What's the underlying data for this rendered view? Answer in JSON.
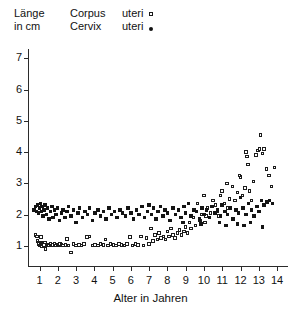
{
  "axis_label_y": {
    "line1": "Länge",
    "line2": "in cm"
  },
  "legend": {
    "items": [
      {
        "label_word1": "Corpus",
        "label_word2": "uteri",
        "marker": "open-square-marker",
        "series": "corpus"
      },
      {
        "label_word1": "Cervix",
        "label_word2": "uteri",
        "marker": "filled-dot-marker",
        "series": "cervix"
      }
    ]
  },
  "xlabel": "Alter in Jahren",
  "yticks": [
    "1",
    "2",
    "3",
    "4",
    "5",
    "6",
    "7"
  ],
  "xticks": [
    "1",
    "2",
    "3",
    "4",
    "5",
    "6",
    "7",
    "8",
    "9",
    "10",
    "11",
    "12",
    "13",
    "14"
  ],
  "chart_data": {
    "type": "scatter",
    "title": "",
    "xlabel": "Alter in Jahren",
    "ylabel": "Länge in cm",
    "xlim": [
      0.4,
      14.6
    ],
    "ylim": [
      0.35,
      7.3
    ],
    "grid": false,
    "legend_position": "top",
    "colors": {
      "corpus": "#1c1c1c",
      "cervix": "#141414"
    },
    "series": [
      {
        "name": "Corpus uteri",
        "marker": "open-square",
        "points": [
          [
            0.78,
            1.35
          ],
          [
            0.86,
            1.3
          ],
          [
            0.9,
            1.15
          ],
          [
            0.95,
            1.1
          ],
          [
            0.98,
            1.05
          ],
          [
            1.02,
            1.0
          ],
          [
            1.05,
            1.02
          ],
          [
            1.08,
            1.28
          ],
          [
            1.12,
            1.08
          ],
          [
            1.15,
            0.98
          ],
          [
            1.2,
            1.05
          ],
          [
            1.25,
            1.02
          ],
          [
            1.3,
            1.1
          ],
          [
            1.34,
            0.9
          ],
          [
            1.4,
            1.0
          ],
          [
            1.46,
            1.03
          ],
          [
            1.52,
            1.0
          ],
          [
            1.6,
            1.05
          ],
          [
            1.68,
            1.0
          ],
          [
            1.75,
            1.02
          ],
          [
            1.82,
            1.06
          ],
          [
            1.9,
            1.0
          ],
          [
            1.98,
            1.03
          ],
          [
            2.05,
            1.0
          ],
          [
            2.12,
            1.05
          ],
          [
            2.2,
            1.02
          ],
          [
            2.3,
            1.0
          ],
          [
            2.42,
            1.02
          ],
          [
            2.5,
            1.22
          ],
          [
            2.6,
            1.0
          ],
          [
            2.72,
            0.78
          ],
          [
            2.85,
            1.05
          ],
          [
            3.0,
            1.0
          ],
          [
            3.15,
            1.02
          ],
          [
            3.3,
            1.0
          ],
          [
            3.45,
            1.05
          ],
          [
            3.6,
            1.28
          ],
          [
            3.75,
            1.3
          ],
          [
            3.9,
            1.0
          ],
          [
            4.05,
            1.03
          ],
          [
            4.2,
            1.0
          ],
          [
            4.35,
            1.05
          ],
          [
            4.5,
            1.02
          ],
          [
            4.62,
            1.2
          ],
          [
            4.75,
            1.0
          ],
          [
            4.9,
            1.05
          ],
          [
            5.05,
            1.02
          ],
          [
            5.2,
            1.0
          ],
          [
            5.35,
            1.05
          ],
          [
            5.5,
            1.03
          ],
          [
            5.65,
            1.0
          ],
          [
            5.8,
            1.05
          ],
          [
            5.95,
            1.28
          ],
          [
            6.1,
            1.0
          ],
          [
            6.25,
            1.05
          ],
          [
            6.4,
            1.02
          ],
          [
            6.55,
            1.3
          ],
          [
            6.7,
            1.0
          ],
          [
            6.85,
            1.25
          ],
          [
            7.0,
            1.05
          ],
          [
            7.1,
            1.55
          ],
          [
            7.2,
            1.15
          ],
          [
            7.32,
            1.35
          ],
          [
            7.45,
            1.2
          ],
          [
            7.55,
            1.4
          ],
          [
            7.65,
            1.25
          ],
          [
            7.78,
            1.3
          ],
          [
            7.9,
            1.2
          ],
          [
            8.0,
            1.45
          ],
          [
            8.1,
            1.3
          ],
          [
            8.2,
            1.55
          ],
          [
            8.3,
            1.35
          ],
          [
            8.42,
            1.25
          ],
          [
            8.55,
            1.4
          ],
          [
            8.65,
            1.5
          ],
          [
            8.78,
            1.35
          ],
          [
            8.9,
            1.45
          ],
          [
            9.0,
            1.6
          ],
          [
            9.1,
            1.4
          ],
          [
            9.2,
            1.75
          ],
          [
            9.3,
            1.55
          ],
          [
            9.42,
            1.9
          ],
          [
            9.55,
            1.65
          ],
          [
            9.65,
            2.35
          ],
          [
            9.78,
            1.8
          ],
          [
            9.9,
            2.0
          ],
          [
            10.0,
            2.6
          ],
          [
            10.1,
            1.95
          ],
          [
            10.2,
            2.2
          ],
          [
            10.35,
            2.05
          ],
          [
            10.5,
            2.45
          ],
          [
            10.62,
            2.3
          ],
          [
            10.75,
            2.1
          ],
          [
            10.9,
            2.6
          ],
          [
            11.0,
            2.75
          ],
          [
            11.12,
            2.35
          ],
          [
            11.25,
            3.0
          ],
          [
            11.4,
            2.5
          ],
          [
            11.55,
            2.9
          ],
          [
            11.7,
            2.45
          ],
          [
            11.85,
            2.7
          ],
          [
            12.0,
            3.2
          ],
          [
            12.1,
            2.6
          ],
          [
            12.25,
            2.85
          ],
          [
            12.4,
            3.6
          ],
          [
            12.5,
            2.75
          ],
          [
            12.6,
            2.45
          ],
          [
            12.72,
            3.05
          ],
          [
            12.85,
            3.9
          ],
          [
            12.95,
            4.05
          ],
          [
            13.05,
            4.1
          ],
          [
            13.1,
            4.55
          ],
          [
            13.2,
            3.95
          ],
          [
            13.3,
            4.1
          ],
          [
            13.42,
            3.45
          ],
          [
            13.55,
            3.25
          ],
          [
            13.7,
            2.9
          ],
          [
            13.85,
            3.5
          ],
          [
            12.3,
            4.0
          ],
          [
            12.35,
            3.85
          ],
          [
            11.95,
            3.25
          ],
          [
            11.3,
            2.2
          ],
          [
            10.8,
            1.95
          ],
          [
            10.05,
            1.75
          ],
          [
            9.6,
            2.1
          ]
        ]
      },
      {
        "name": "Cervix uteri",
        "marker": "filled-square",
        "points": [
          [
            0.7,
            2.15
          ],
          [
            0.78,
            2.25
          ],
          [
            0.85,
            2.1
          ],
          [
            0.9,
            2.3
          ],
          [
            0.95,
            2.05
          ],
          [
            1.0,
            2.2
          ],
          [
            1.05,
            2.35
          ],
          [
            1.1,
            2.1
          ],
          [
            1.15,
            2.25
          ],
          [
            1.2,
            1.95
          ],
          [
            1.25,
            2.15
          ],
          [
            1.3,
            2.3
          ],
          [
            1.38,
            2.0
          ],
          [
            1.45,
            2.2
          ],
          [
            1.52,
            1.85
          ],
          [
            1.6,
            2.1
          ],
          [
            1.68,
            2.25
          ],
          [
            1.75,
            1.9
          ],
          [
            1.82,
            2.15
          ],
          [
            1.9,
            2.0
          ],
          [
            2.0,
            2.2
          ],
          [
            2.1,
            1.8
          ],
          [
            2.2,
            2.05
          ],
          [
            2.3,
            2.15
          ],
          [
            2.4,
            1.9
          ],
          [
            2.5,
            2.1
          ],
          [
            2.6,
            2.25
          ],
          [
            2.72,
            1.95
          ],
          [
            2.85,
            2.15
          ],
          [
            3.0,
            1.75
          ],
          [
            3.1,
            2.05
          ],
          [
            3.2,
            2.2
          ],
          [
            3.35,
            1.9
          ],
          [
            3.5,
            2.1
          ],
          [
            3.62,
            2.0
          ],
          [
            3.75,
            2.2
          ],
          [
            3.9,
            1.8
          ],
          [
            4.05,
            2.05
          ],
          [
            4.2,
            2.15
          ],
          [
            4.35,
            1.95
          ],
          [
            4.5,
            2.1
          ],
          [
            4.65,
            1.85
          ],
          [
            4.8,
            2.2
          ],
          [
            4.95,
            2.0
          ],
          [
            5.1,
            2.1
          ],
          [
            5.25,
            1.9
          ],
          [
            5.4,
            2.15
          ],
          [
            5.55,
            2.05
          ],
          [
            5.7,
            1.95
          ],
          [
            5.85,
            2.2
          ],
          [
            6.0,
            2.05
          ],
          [
            6.15,
            1.85
          ],
          [
            6.3,
            2.15
          ],
          [
            6.45,
            2.0
          ],
          [
            6.6,
            2.25
          ],
          [
            6.75,
            1.9
          ],
          [
            6.9,
            2.1
          ],
          [
            7.0,
            2.3
          ],
          [
            7.12,
            2.0
          ],
          [
            7.25,
            2.2
          ],
          [
            7.38,
            1.85
          ],
          [
            7.5,
            2.1
          ],
          [
            7.62,
            2.25
          ],
          [
            7.75,
            1.95
          ],
          [
            7.88,
            2.15
          ],
          [
            8.0,
            2.05
          ],
          [
            8.15,
            1.8
          ],
          [
            8.3,
            2.2
          ],
          [
            8.45,
            2.0
          ],
          [
            8.6,
            2.15
          ],
          [
            8.75,
            1.9
          ],
          [
            8.9,
            2.25
          ],
          [
            9.0,
            2.05
          ],
          [
            9.15,
            2.35
          ],
          [
            9.3,
            1.95
          ],
          [
            9.45,
            2.15
          ],
          [
            9.6,
            2.1
          ],
          [
            9.75,
            1.85
          ],
          [
            9.9,
            2.2
          ],
          [
            10.0,
            2.0
          ],
          [
            10.15,
            2.15
          ],
          [
            10.3,
            1.9
          ],
          [
            10.45,
            2.25
          ],
          [
            10.6,
            2.05
          ],
          [
            10.75,
            2.15
          ],
          [
            10.9,
            1.95
          ],
          [
            11.0,
            2.3
          ],
          [
            11.15,
            2.1
          ],
          [
            11.3,
            2.0
          ],
          [
            11.45,
            2.2
          ],
          [
            11.6,
            1.85
          ],
          [
            11.75,
            2.15
          ],
          [
            11.9,
            2.05
          ],
          [
            12.0,
            2.55
          ],
          [
            12.15,
            2.2
          ],
          [
            12.3,
            2.0
          ],
          [
            12.45,
            2.35
          ],
          [
            12.6,
            2.15
          ],
          [
            12.75,
            1.95
          ],
          [
            12.9,
            2.25
          ],
          [
            13.0,
            2.1
          ],
          [
            13.15,
            2.45
          ],
          [
            13.3,
            2.3
          ],
          [
            13.45,
            2.4
          ],
          [
            13.6,
            2.45
          ],
          [
            13.75,
            2.35
          ],
          [
            12.55,
            1.75
          ],
          [
            11.85,
            1.7
          ],
          [
            10.85,
            1.75
          ],
          [
            9.85,
            1.7
          ],
          [
            8.85,
            1.75
          ],
          [
            13.2,
            1.6
          ],
          [
            12.2,
            1.65
          ],
          [
            11.2,
            1.65
          ]
        ]
      }
    ]
  }
}
